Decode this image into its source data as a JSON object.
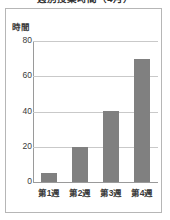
{
  "chart_data": {
    "type": "bar",
    "title": "週別授業時間（4月）",
    "xlabel": "",
    "ylabel": "時間",
    "categories": [
      "第1週",
      "第2週",
      "第3週",
      "第4週"
    ],
    "values": [
      5,
      20,
      40,
      70
    ],
    "ylim": [
      0,
      80
    ],
    "yticks": [
      0,
      20,
      40,
      60,
      80
    ],
    "ytick_labels": [
      "0",
      "20",
      "40",
      "60",
      "80"
    ],
    "grid": true,
    "legend": "none",
    "bar_color": "#808080",
    "grid_color": "#c9c9c9",
    "axis_color": "#9a9a9a",
    "frame_color": "#b6b6b6",
    "background": "#ffffff",
    "text_color": "#3a3a3a"
  }
}
